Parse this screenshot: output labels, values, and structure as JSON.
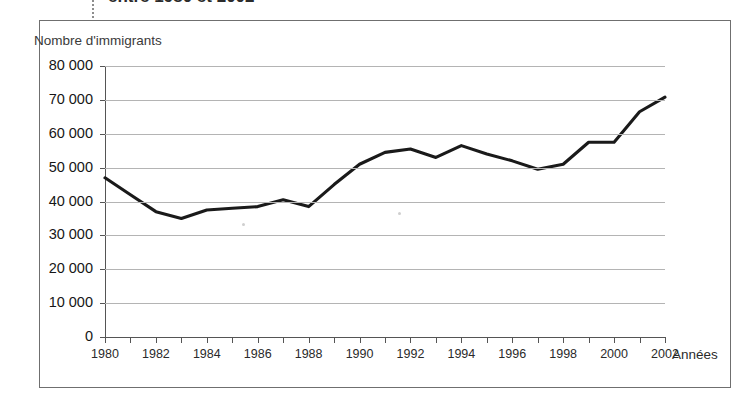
{
  "figure": {
    "clipped_heading": "entre 1980 et 2002",
    "y_axis_title": "Nombre d'immigrants",
    "x_axis_title": "Années"
  },
  "colors": {
    "line": "#1a1a1a",
    "frame": "#6f6f6f",
    "gridline": "#b4b4b4",
    "axis": "#555555",
    "background": "#ffffff"
  },
  "chart_data": {
    "type": "line",
    "title": "entre 1980 et 2002",
    "xlabel": "Années",
    "ylabel": "Nombre d'immigrants",
    "xlim": [
      1980,
      2002
    ],
    "ylim": [
      0,
      80000
    ],
    "ytick_labels": [
      "0",
      "10 000",
      "20 000",
      "30 000",
      "40 000",
      "50 000",
      "60 000",
      "70 000",
      "80 000"
    ],
    "ytick_values": [
      0,
      10000,
      20000,
      30000,
      40000,
      50000,
      60000,
      70000,
      80000
    ],
    "xtick_labels": [
      "1980",
      "1982",
      "1984",
      "1986",
      "1988",
      "1990",
      "1992",
      "1994",
      "1996",
      "1998",
      "2000",
      "2002"
    ],
    "xtick_values": [
      1980,
      1982,
      1984,
      1986,
      1988,
      1990,
      1992,
      1994,
      1996,
      1998,
      2000,
      2002
    ],
    "minor_xticks_every": 1,
    "grid": "horizontal",
    "legend": "none",
    "x": [
      1980,
      1981,
      1982,
      1983,
      1984,
      1985,
      1986,
      1987,
      1988,
      1989,
      1990,
      1991,
      1992,
      1993,
      1994,
      1995,
      1996,
      1997,
      1998,
      1999,
      2000,
      2001,
      2002
    ],
    "values": [
      47000,
      42000,
      37000,
      35000,
      37500,
      38000,
      38500,
      40500,
      38500,
      45000,
      51000,
      54500,
      55500,
      53000,
      56500,
      54000,
      52000,
      49500,
      51000,
      57500,
      57500,
      66500,
      70800
    ],
    "series": [
      {
        "name": "Nombre d'immigrants",
        "values": [
          47000,
          42000,
          37000,
          35000,
          37500,
          38000,
          38500,
          40500,
          38500,
          45000,
          51000,
          54500,
          55500,
          53000,
          56500,
          54000,
          52000,
          49500,
          51000,
          57500,
          57500,
          66500,
          70800
        ]
      }
    ]
  }
}
